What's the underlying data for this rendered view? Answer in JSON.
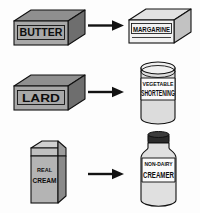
{
  "diagram": {
    "background_color": "#fdfdfd",
    "ink_color": "#111111",
    "arrow_color": "#121212",
    "style": "black-and-white line art"
  },
  "rows": [
    {
      "id": "row-butter-margarine",
      "arrow": {
        "name": "arrow-right-icon",
        "direction": "right"
      },
      "source": {
        "name": "butter-box",
        "shape": "box",
        "label": "BUTTER",
        "label_lines": [
          "BUTTER"
        ],
        "front_color": "#a8a8a8",
        "top_color": "#8f8f8f",
        "side_color": "#6e6e6e"
      },
      "target": {
        "name": "margarine-box",
        "shape": "box",
        "label": "MARGARINE",
        "label_lines": [
          "MARGARINE"
        ],
        "front_color": "#f2f2f2",
        "top_color": "#e2e2e2",
        "side_color": "#c2c2c2"
      }
    },
    {
      "id": "row-lard-shortening",
      "arrow": {
        "name": "arrow-right-icon",
        "direction": "right"
      },
      "source": {
        "name": "lard-box",
        "shape": "box",
        "label": "LARD",
        "label_lines": [
          "LARD"
        ],
        "front_color": "#a8a8a8",
        "top_color": "#8f8f8f",
        "side_color": "#6e6e6e"
      },
      "target": {
        "name": "vegetable-shortening-can",
        "shape": "can",
        "label": "VEGETABLE SHORTENING",
        "label_lines": [
          "VEGETABLE",
          "SHORTENING"
        ],
        "body_color": "#dcdcdc",
        "lid_color": "#f0f0f0",
        "label_band_color": "#fbfbfb"
      }
    },
    {
      "id": "row-cream-creamer",
      "arrow": {
        "name": "arrow-right-icon",
        "direction": "right"
      },
      "source": {
        "name": "real-cream-carton",
        "shape": "carton",
        "label": "REAL CREAM",
        "label_lines": [
          "REAL",
          "CREAM"
        ],
        "front_color": "#b4b4b4",
        "side_color": "#8a8a8a",
        "top_color": "#d0d0d0"
      },
      "target": {
        "name": "non-dairy-creamer-jar",
        "shape": "jar",
        "label": "NON-DAIRY CREAMER",
        "label_lines": [
          "NON-DAIRY",
          "CREAMER"
        ],
        "body_color": "#e0e0e0",
        "cap_color": "#2b2b2b",
        "label_band_color": "#fbfbfb"
      }
    }
  ]
}
